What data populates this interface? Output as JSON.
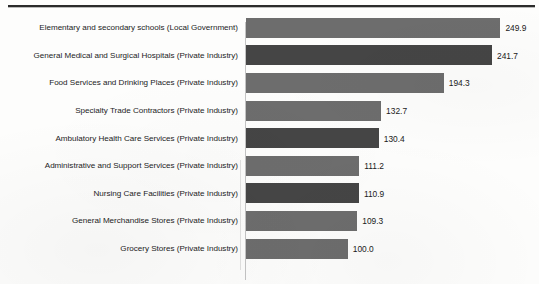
{
  "chart_data": {
    "type": "bar",
    "orientation": "horizontal",
    "title": "",
    "subtitle": "",
    "xlabel": "",
    "ylabel": "",
    "grid": false,
    "legend": null,
    "xlim": [
      0,
      260
    ],
    "value_label_format": "one-decimal",
    "categories": [
      "Elementary and secondary schools (Local Government)",
      "General Medical and Surgical Hospitals (Private Industry)",
      "Food Services and Drinking Places (Private Industry)",
      "Specialty Trade Contractors (Private Industry)",
      "Ambulatory Health Care Services (Private Industry)",
      "Administrative and Support Services (Private Industry)",
      "Nursing Care Facilities (Private Industry)",
      "General Merchandise Stores (Private Industry)",
      "Grocery Stores (Private Industry)"
    ],
    "values": [
      249.9,
      241.7,
      194.3,
      132.7,
      130.4,
      111.2,
      110.9,
      109.3,
      100.0
    ],
    "value_labels": [
      "249.9",
      "241.7",
      "194.3",
      "132.7",
      "130.4",
      "111.2",
      "110.9",
      "109.3",
      "100.0"
    ],
    "bar_colors": [
      "#6d6d6d",
      "#454545",
      "#6d6d6d",
      "#6d6d6d",
      "#454545",
      "#6d6d6d",
      "#454545",
      "#6d6d6d",
      "#6d6d6d"
    ]
  }
}
